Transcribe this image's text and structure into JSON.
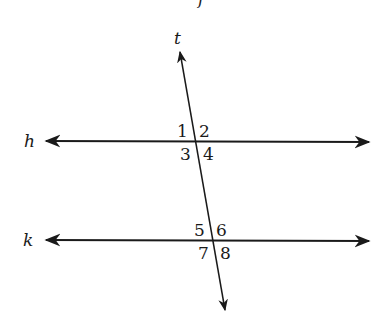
{
  "diagram": {
    "type": "parallel-lines-cut-by-transversal",
    "top_partial_label": "f",
    "lines": {
      "h": {
        "label": "h"
      },
      "k": {
        "label": "k"
      },
      "t": {
        "label": "t"
      }
    },
    "angles": {
      "a1": "1",
      "a2": "2",
      "a3": "3",
      "a4": "4",
      "a5": "5",
      "a6": "6",
      "a7": "7",
      "a8": "8"
    },
    "colors": {
      "stroke": "#1a1a1a",
      "background": "#ffffff"
    }
  }
}
